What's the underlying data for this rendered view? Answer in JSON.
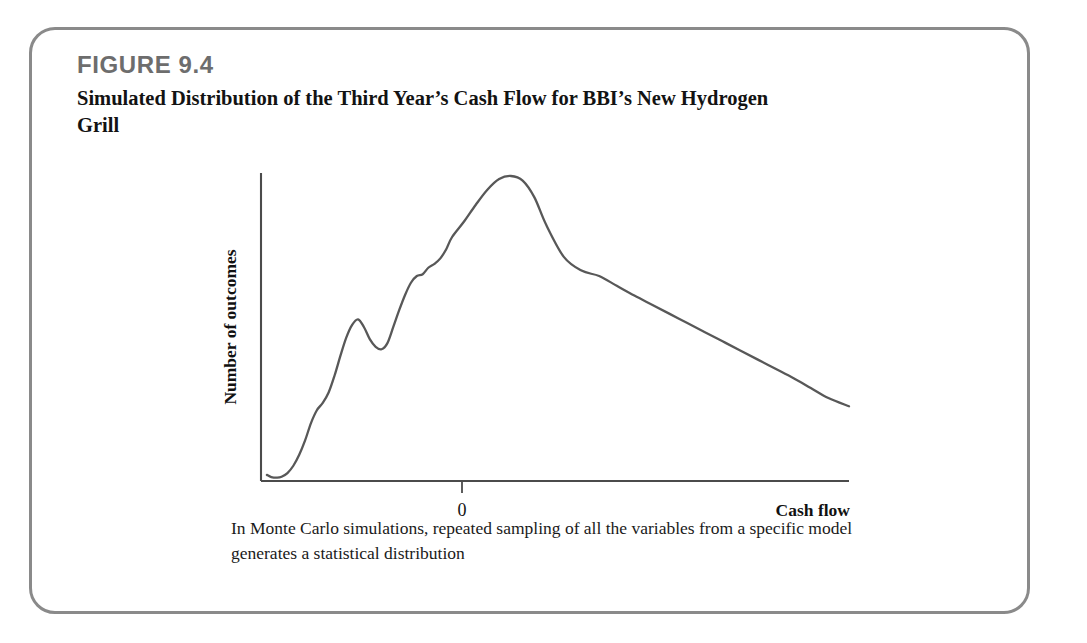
{
  "figure": {
    "number_label": "FIGURE 9.4",
    "title": "Simulated Distribution of the Third Year’s Cash Flow for BBI’s New Hydrogen Grill",
    "caption": "In Monte Carlo simulations, repeated sampling of all the variables from a specific model generates a statistical distribution",
    "border_color": "#8a8a8a",
    "number_color": "#6d6d6d"
  },
  "chart_data": {
    "type": "line",
    "title": "Simulated Distribution of the Third Year’s Cash Flow for BBI’s New Hydrogen Grill",
    "xlabel": "Cash flow",
    "ylabel": "Number of outcomes",
    "grid": false,
    "legend": "none",
    "axis_tick_labels": {
      "x": [
        "0"
      ],
      "y": []
    },
    "xlim": [
      -1.0,
      3.0
    ],
    "ylim": [
      0,
      1
    ],
    "series": [
      {
        "name": "Simulated outcomes",
        "color": "#585858",
        "x": [
          -0.96,
          -0.93,
          -0.89,
          -0.86,
          -0.82,
          -0.78,
          -0.74,
          -0.7,
          -0.66,
          -0.62,
          -0.58,
          -0.54,
          -0.5,
          -0.46,
          -0.42,
          -0.38,
          -0.34,
          -0.3,
          -0.26,
          -0.22,
          -0.18,
          -0.14,
          -0.1,
          -0.06,
          -0.02,
          0.02,
          0.06,
          0.1,
          0.14,
          0.18,
          0.22,
          0.26,
          0.3,
          0.38,
          0.46,
          0.54,
          0.62,
          0.7,
          0.78,
          0.86,
          0.94,
          1.06,
          1.18,
          1.3,
          1.42,
          1.54,
          1.66,
          1.78,
          1.9,
          2.02,
          2.14,
          2.26,
          2.38,
          2.5,
          2.62,
          2.74,
          2.86,
          3.0
        ],
        "y": [
          0.02,
          0.013,
          0.011,
          0.014,
          0.026,
          0.05,
          0.086,
          0.133,
          0.19,
          0.232,
          0.256,
          0.29,
          0.345,
          0.41,
          0.47,
          0.512,
          0.53,
          0.505,
          0.465,
          0.44,
          0.432,
          0.452,
          0.505,
          0.56,
          0.61,
          0.65,
          0.672,
          0.678,
          0.7,
          0.712,
          0.73,
          0.76,
          0.8,
          0.85,
          0.905,
          0.955,
          0.99,
          1.0,
          0.985,
          0.93,
          0.84,
          0.735,
          0.69,
          0.672,
          0.64,
          0.608,
          0.578,
          0.548,
          0.518,
          0.488,
          0.458,
          0.428,
          0.398,
          0.368,
          0.338,
          0.305,
          0.272,
          0.245
        ]
      }
    ]
  }
}
